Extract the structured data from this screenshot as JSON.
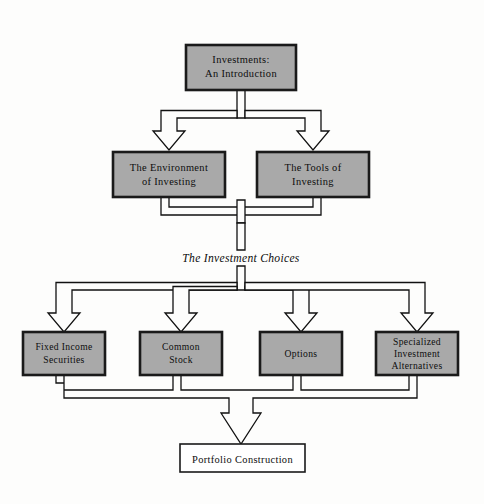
{
  "diagram": {
    "background_color": "#fdfdfc",
    "box_fill_color": "#a9a9a9",
    "box_stroke_color": "#1a1a1a",
    "connector_stroke_color": "#111111",
    "root": {
      "label_line_1": "Investments:",
      "label_line_2": "An Introduction"
    },
    "level_two": [
      {
        "label_line_1": "The Environment",
        "label_line_2": "of Investing"
      },
      {
        "label_line_1": "The Tools of",
        "label_line_2": "Investing"
      }
    ],
    "stage_caption": "The Investment Choices",
    "level_three": [
      {
        "label_line_1": "Fixed Income",
        "label_line_2": "Securities",
        "label_line_3": ""
      },
      {
        "label_line_1": "Common",
        "label_line_2": "Stock",
        "label_line_3": ""
      },
      {
        "label_line_1": "Options",
        "label_line_2": "",
        "label_line_3": ""
      },
      {
        "label_line_1": "Specialized",
        "label_line_2": "Investment",
        "label_line_3": "Alternatives"
      }
    ],
    "terminal": {
      "label": "Portfolio Construction"
    }
  }
}
